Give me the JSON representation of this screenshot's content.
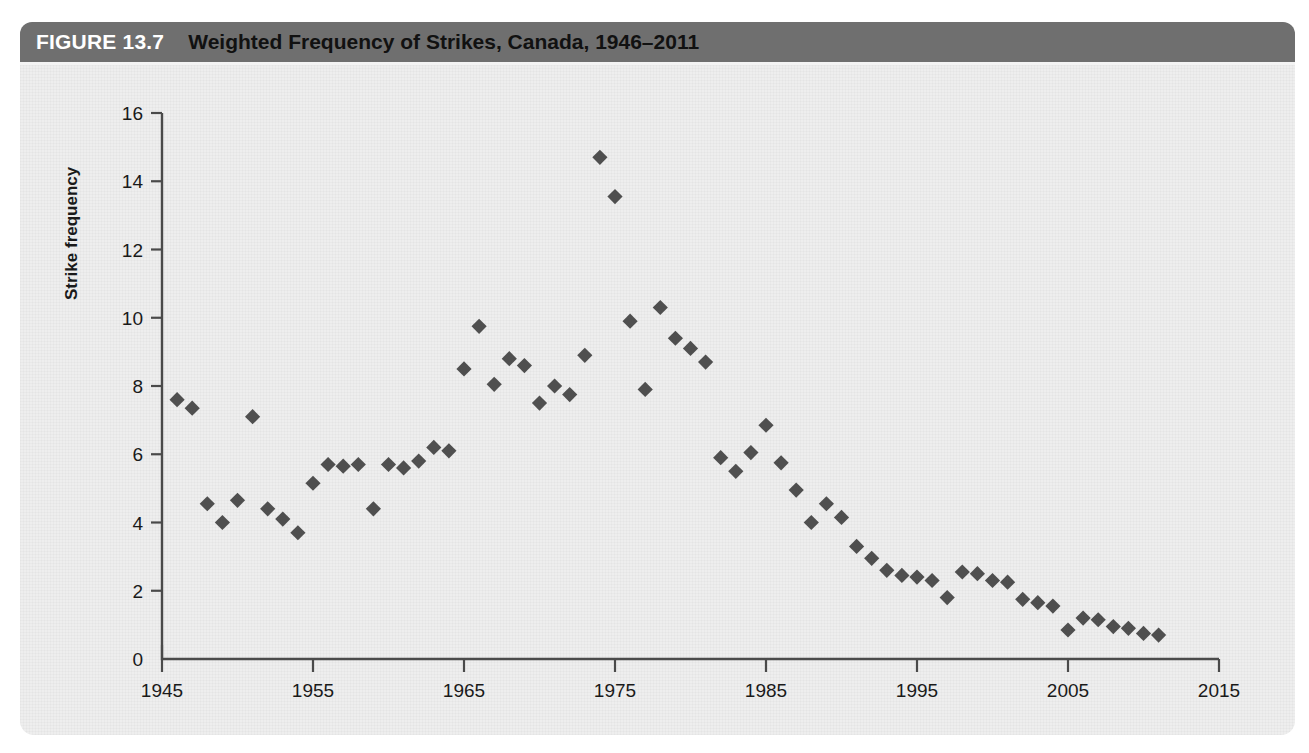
{
  "figure": {
    "label": "FIGURE 13.7",
    "title": "Weighted Frequency of Strikes, Canada, 1946–2011"
  },
  "colors": {
    "header_bar": "#6f6f6f",
    "header_label_text": "#ffffff",
    "header_title_text": "#111111",
    "panel_background": "#eeeeee",
    "marker": "#4f4f4f",
    "axis": "#4a4a4a"
  },
  "chart_data": {
    "type": "scatter",
    "title": "Weighted Frequency of Strikes, Canada, 1946–2011",
    "xlabel": "",
    "ylabel": "Strike frequency",
    "xlim": [
      1945,
      2015
    ],
    "ylim": [
      0,
      16
    ],
    "xticks": [
      1945,
      1955,
      1965,
      1975,
      1985,
      1995,
      2005,
      2015
    ],
    "yticks": [
      0,
      2,
      4,
      6,
      8,
      10,
      12,
      14,
      16
    ],
    "grid": false,
    "legend": null,
    "marker_shape": "diamond",
    "series": [
      {
        "name": "Strike frequency",
        "x": [
          1946,
          1947,
          1948,
          1949,
          1950,
          1951,
          1952,
          1953,
          1954,
          1955,
          1956,
          1957,
          1958,
          1959,
          1960,
          1961,
          1962,
          1963,
          1964,
          1965,
          1966,
          1967,
          1968,
          1969,
          1970,
          1971,
          1972,
          1973,
          1974,
          1975,
          1976,
          1977,
          1978,
          1979,
          1980,
          1981,
          1982,
          1983,
          1984,
          1985,
          1986,
          1987,
          1988,
          1989,
          1990,
          1991,
          1992,
          1993,
          1994,
          1995,
          1996,
          1997,
          1998,
          1999,
          2000,
          2001,
          2002,
          2003,
          2004,
          2005,
          2006,
          2007,
          2008,
          2009,
          2010,
          2011
        ],
        "y": [
          7.6,
          7.35,
          4.55,
          4.0,
          4.65,
          7.1,
          4.4,
          4.1,
          3.7,
          5.15,
          5.7,
          5.65,
          5.7,
          4.4,
          5.7,
          5.6,
          5.8,
          6.2,
          6.1,
          8.5,
          9.75,
          8.05,
          8.8,
          8.6,
          7.5,
          8.0,
          7.75,
          8.9,
          14.7,
          13.55,
          9.9,
          7.9,
          10.3,
          9.4,
          9.1,
          8.7,
          5.9,
          5.5,
          6.05,
          6.85,
          5.75,
          4.95,
          4.0,
          4.55,
          4.15,
          3.3,
          2.95,
          2.6,
          2.45,
          2.4,
          2.3,
          1.8,
          2.55,
          2.5,
          2.3,
          2.25,
          1.75,
          1.65,
          1.55,
          0.85,
          1.2,
          1.15,
          0.95,
          0.9,
          0.75,
          0.7
        ]
      }
    ]
  }
}
